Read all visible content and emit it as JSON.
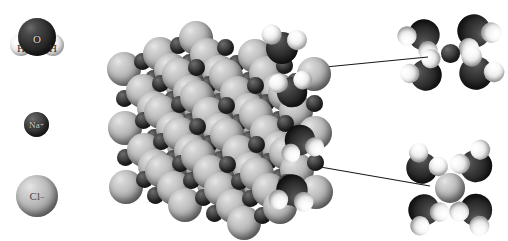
{
  "figure": {
    "background_color": "#ffffff",
    "width": 503,
    "height": 241,
    "style": "space-filling (CPK) molecular model, greyscale"
  },
  "colors": {
    "background": "#ffffff",
    "chloride": "#b8b8b8",
    "sodium": "#333333",
    "oxygen": "#1f1f1f",
    "hydrogen": "#f2f2f2",
    "leader_line": "#1a1a1a"
  },
  "legend": {
    "name": "species-key",
    "items": [
      {
        "id": "water",
        "formula": "H2O",
        "atom_labels": [
          "O",
          "H",
          "H"
        ],
        "oxygen_label": "O",
        "hydrogen_label_left": "H",
        "hydrogen_label_right": "H",
        "description": "water molecule"
      },
      {
        "id": "sodium-ion",
        "label": "Na",
        "charge": "+",
        "description": "sodium cation"
      },
      {
        "id": "chloride-ion",
        "label": "Cl",
        "charge": "–",
        "description": "chloride anion"
      }
    ]
  },
  "crystal": {
    "name": "sodium-chloride-crystal",
    "description": "Cubic NaCl lattice of large light-grey chloride spheres with small dark sodium spheres at alternating sites",
    "large_sphere_species": "Cl-",
    "small_sphere_species": "Na+",
    "hydration_note": "water molecules attached along the right-hand face of the crystal"
  },
  "callouts": [
    {
      "id": "hydrated-sodium",
      "position": "top-right",
      "center_ion": "Na+",
      "center_ion_size": "small",
      "shell_molecules": 4,
      "shell_species": "H2O",
      "orientation": "oxygen atoms point toward the cation",
      "leader_from": [
        305,
        69
      ],
      "leader_to": [
        424,
        58
      ]
    },
    {
      "id": "hydrated-chloride",
      "position": "bottom-right",
      "center_ion": "Cl-",
      "center_ion_size": "large",
      "shell_molecules": 4,
      "shell_species": "H2O",
      "orientation": "hydrogen atoms point toward the anion",
      "leader_from": [
        303,
        164
      ],
      "leader_to": [
        425,
        185
      ]
    }
  ]
}
